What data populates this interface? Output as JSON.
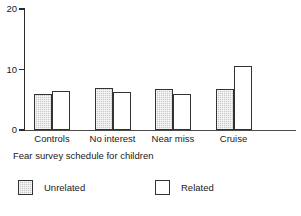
{
  "chart_data": {
    "type": "bar",
    "title": "",
    "xlabel": "Fear survey schedule for children",
    "ylabel": "",
    "categories": [
      "Controls",
      "No interest",
      "Near miss",
      "Cruise"
    ],
    "series": [
      {
        "name": "Unrelated",
        "values": [
          6.0,
          7.0,
          6.8,
          6.8
        ],
        "swatch": "shaded"
      },
      {
        "name": "Related",
        "values": [
          6.4,
          6.2,
          6.0,
          10.6
        ],
        "swatch": "white"
      }
    ],
    "ylim": [
      0,
      20
    ],
    "yticks": [
      0,
      10,
      20
    ],
    "ytick_labels": [
      "0",
      "10",
      "20"
    ],
    "grid": false,
    "legend_position": "bottom"
  },
  "axis": {
    "y_ticks": [
      {
        "label": "20",
        "value": 20
      },
      {
        "label": "10",
        "value": 10
      },
      {
        "label": "0",
        "value": 0
      }
    ]
  },
  "legend": {
    "items": [
      {
        "label": "Unrelated"
      },
      {
        "label": "Related"
      }
    ]
  }
}
